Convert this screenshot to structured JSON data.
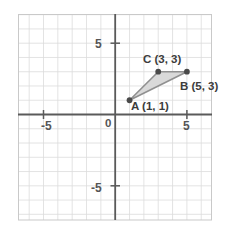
{
  "figure": {
    "background_color": "#ffffff"
  },
  "chart_data": {
    "type": "scatter",
    "title": "",
    "xlabel": "",
    "ylabel": "",
    "xlim": [
      -6.8,
      6.8
    ],
    "ylim": [
      -7.0,
      7.4
    ],
    "grid": true,
    "grid_spacing": 1,
    "grid_color": "#d8d8d8",
    "axis_color": "#5a5a5a",
    "border_color": "#c8c8c8",
    "legend": "none",
    "x_ticks": [
      -5,
      5
    ],
    "x_tick_labels": [
      "-5",
      "5"
    ],
    "y_ticks": [
      5,
      -5
    ],
    "y_tick_labels": [
      "5",
      "-5"
    ],
    "origin_label": "0",
    "shapes": [
      {
        "name": "triangle-abc",
        "kind": "polygon",
        "fill": "#d9d9d9",
        "stroke": "#8c8c8c",
        "vertices": [
          {
            "label": "A",
            "x": 1,
            "y": 1
          },
          {
            "label": "B",
            "x": 5,
            "y": 3
          },
          {
            "label": "C",
            "x": 3,
            "y": 3
          }
        ]
      }
    ],
    "points": [
      {
        "label": "A",
        "x": 1,
        "y": 1,
        "text": "A (1, 1)",
        "color": "#4a4a4a"
      },
      {
        "label": "B",
        "x": 5,
        "y": 3,
        "text": "B (5, 3)",
        "color": "#4a4a4a"
      },
      {
        "label": "C",
        "x": 3,
        "y": 3,
        "text": "C (3, 3)",
        "color": "#4a4a4a"
      }
    ]
  },
  "labels": {
    "x_neg5": "-5",
    "x_pos5": "5",
    "y_pos5": "5",
    "y_neg5": "-5",
    "origin": "0",
    "point_a": "A (1, 1)",
    "point_b": "B (5, 3)",
    "point_c": "C (3, 3)"
  }
}
